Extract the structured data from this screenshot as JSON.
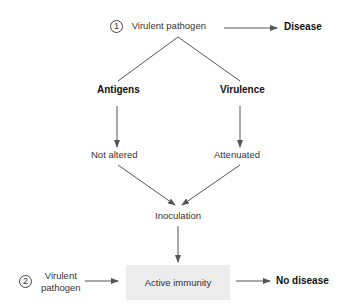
{
  "diagram": {
    "scenario1": {
      "number": "1",
      "source": "Virulent pathogen",
      "outcome": "Disease"
    },
    "branches": {
      "left": {
        "property": "Antigens",
        "state": "Not altered"
      },
      "right": {
        "property": "Virulence",
        "state": "Attenuated"
      }
    },
    "process": "Inoculation",
    "scenario2": {
      "number": "2",
      "source_line1": "Virulent",
      "source_line2": "pathogen",
      "state_box": "Active immunity",
      "outcome": "No disease"
    },
    "colors": {
      "line": "#555555",
      "box_fill": "#ececec",
      "text": "#333333"
    }
  }
}
